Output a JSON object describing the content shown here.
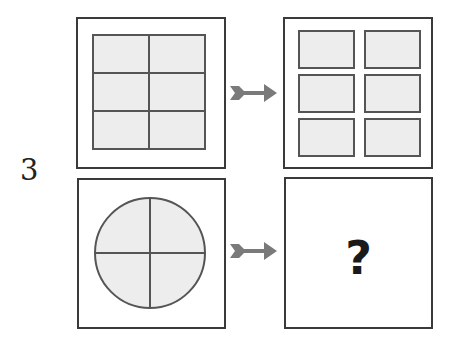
{
  "puzzle": {
    "number": "3",
    "question_mark": "?",
    "colors": {
      "frame": "#3a3a3a",
      "cell_fill": "#ededed",
      "cell_stroke": "#555555",
      "arrow": "#7a7a7a"
    },
    "top_row": {
      "left_figure": "square divided into 2x3 grid",
      "right_figure": "six separated rectangles in 2 columns x 3 rows",
      "arrow_icon": "arrow-right-icon"
    },
    "bottom_row": {
      "left_figure": "circle divided into 4 quadrants",
      "right_figure": "unknown answer",
      "arrow_icon": "arrow-right-icon"
    }
  }
}
